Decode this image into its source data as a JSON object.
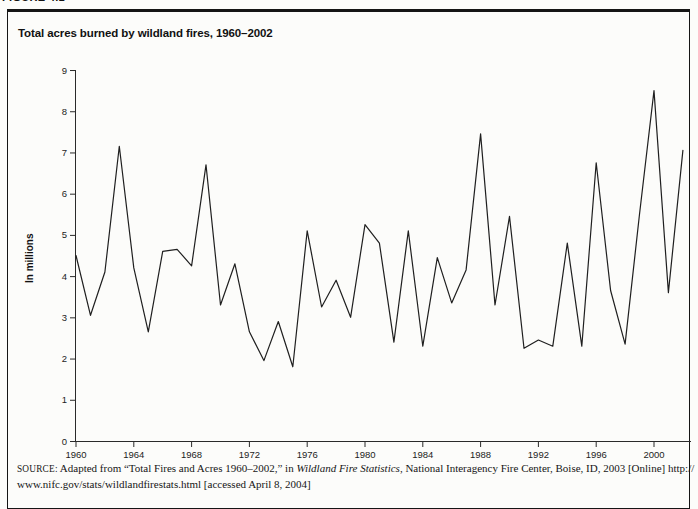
{
  "page": {
    "figure_label_partial": "FIGURE 4.1"
  },
  "figure": {
    "title": "Total acres burned by wildland fires, 1960–2002",
    "y_axis_title": "In millions",
    "source": {
      "label": "SOURCE:",
      "part1": " Adapted from “Total Fires and Acres 1960–2002,” in ",
      "italic": "Wildland Fire Statistics",
      "part2": ", National Interagency Fire Center, Boise, ID, 2003 [Online] http://",
      "line2": "www.nifc.gov/stats/wildlandfirestats.html [accessed April 8, 2004]"
    }
  },
  "chart_data": {
    "type": "line",
    "title": "Total acres burned by wildland fires, 1960–2002",
    "xlabel": "",
    "ylabel": "In millions",
    "ylim": [
      0,
      9
    ],
    "xlim": [
      1960,
      2002
    ],
    "grid": false,
    "legend": "none",
    "line_color": "#1f1f1f",
    "y_ticks": [
      0,
      1,
      2,
      3,
      4,
      5,
      6,
      7,
      8,
      9
    ],
    "x_ticks": [
      1960,
      1964,
      1968,
      1972,
      1976,
      1980,
      1984,
      1988,
      1992,
      1996,
      2000
    ],
    "x": [
      1960,
      1961,
      1962,
      1963,
      1964,
      1965,
      1966,
      1967,
      1968,
      1969,
      1970,
      1971,
      1972,
      1973,
      1974,
      1975,
      1976,
      1977,
      1978,
      1979,
      1980,
      1981,
      1982,
      1983,
      1984,
      1985,
      1986,
      1987,
      1988,
      1989,
      1990,
      1991,
      1992,
      1993,
      1994,
      1995,
      1996,
      1997,
      1998,
      1999,
      2000,
      2001,
      2002
    ],
    "values": [
      4.5,
      3.05,
      4.1,
      7.15,
      4.2,
      2.65,
      4.6,
      4.65,
      4.25,
      6.7,
      3.3,
      4.3,
      2.65,
      1.95,
      2.9,
      1.8,
      5.1,
      3.25,
      3.9,
      3.0,
      5.25,
      4.8,
      2.4,
      5.1,
      2.3,
      4.45,
      3.35,
      4.15,
      7.45,
      3.3,
      5.45,
      2.25,
      2.45,
      2.3,
      4.8,
      2.3,
      6.75,
      3.65,
      2.35,
      5.5,
      8.5,
      3.6,
      7.05
    ]
  }
}
